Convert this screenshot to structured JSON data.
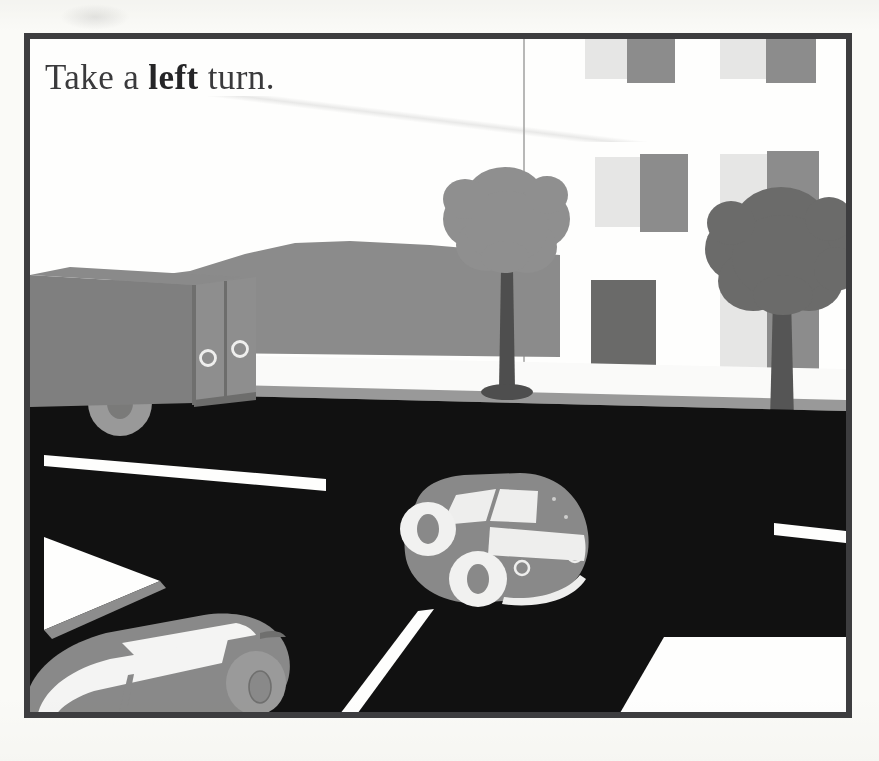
{
  "page": {
    "background_color": "#fbfbf9",
    "frame_color": "#3d3d3f",
    "frame_border_width": 6
  },
  "caption": {
    "text_before": "Take a ",
    "emphasis": "left",
    "text_after": " turn.",
    "full_text": "Take a left turn.",
    "color": "#3a3a3c"
  },
  "illustration": {
    "title": "Street scene with cars at an intersection",
    "sky_color": "#ffffff",
    "road_color": "#111111",
    "sidewalk_color": "#fbfbfb",
    "curb_color": "#9a9a9a",
    "hill_color": "#8c8c8c",
    "lane_marking_color": "#ffffff"
  },
  "building": {
    "name": "corner-building",
    "facade_color": "#ffffff",
    "edge_line_color": "#b9b9b9",
    "door": {
      "color": "#6a6a6a",
      "x": 561,
      "y": 241,
      "w": 65,
      "h": 100
    },
    "windows": [
      {
        "x": 555,
        "y": -6,
        "w": 42,
        "h": 46,
        "color": "#e7e7e7"
      },
      {
        "x": 597,
        "y": -6,
        "w": 48,
        "h": 50,
        "color": "#8d8d8d"
      },
      {
        "x": 690,
        "y": -6,
        "w": 46,
        "h": 46,
        "color": "#e7e7e7"
      },
      {
        "x": 736,
        "y": -6,
        "w": 50,
        "h": 50,
        "color": "#8d8d8d"
      },
      {
        "x": 818,
        "y": -6,
        "w": 40,
        "h": 46,
        "color": "#e7e7e7"
      },
      {
        "x": 565,
        "y": 118,
        "w": 45,
        "h": 70,
        "color": "#e7e7e7"
      },
      {
        "x": 610,
        "y": 115,
        "w": 48,
        "h": 78,
        "color": "#8d8d8d"
      },
      {
        "x": 690,
        "y": 115,
        "w": 47,
        "h": 75,
        "color": "#e7e7e7"
      },
      {
        "x": 737,
        "y": 112,
        "w": 52,
        "h": 80,
        "color": "#8d8d8d"
      },
      {
        "x": 820,
        "y": 115,
        "w": 40,
        "h": 72,
        "color": "#e7e7e7"
      },
      {
        "x": 690,
        "y": 250,
        "w": 47,
        "h": 95,
        "color": "#e7e7e7"
      },
      {
        "x": 737,
        "y": 248,
        "w": 52,
        "h": 98,
        "color": "#8d8d8d"
      },
      {
        "x": 820,
        "y": 250,
        "w": 40,
        "h": 92,
        "color": "#e7e7e7"
      }
    ]
  },
  "trees": [
    {
      "name": "tree-left",
      "canopy_color": "#909090",
      "trunk_color": "#4e4e4e",
      "base_color": "#4e4e4e",
      "center_x": 475,
      "canopy_top": 118,
      "trunk_bottom": 362
    },
    {
      "name": "tree-right",
      "canopy_color": "#6b6b6b",
      "trunk_color": "#555555",
      "base_color": "#555555",
      "center_x": 750,
      "canopy_top": 137,
      "trunk_bottom": 385
    }
  ],
  "vehicles": [
    {
      "name": "box-truck",
      "type": "truck",
      "body_color": "#808080",
      "rear_door_color": "#8f8f8f",
      "rear_door_shadow": "#6d6d6d",
      "wheel_color": "#9a9a9a",
      "hub_color": "#7a7a7a",
      "handles": 2,
      "position": "upper-left, exiting frame"
    },
    {
      "name": "car-center",
      "type": "car",
      "body_color": "#8a8a8a",
      "glass_color": "#efefef",
      "wheel_color": "#f2f2f2",
      "tire_color": "#8a8a8a",
      "taillights": 2,
      "position": "center of road, turning left"
    },
    {
      "name": "car-lower-left",
      "type": "car",
      "body_color": "#8a8a8a",
      "glass_color": "#f5f5f5",
      "wheel_color": "#9b9b9b",
      "position": "bottom-left, cropped by frame"
    }
  ],
  "road_markings": [
    {
      "name": "lane-line-upper-left",
      "color": "#ffffff"
    },
    {
      "name": "lane-line-center",
      "color": "#ffffff"
    },
    {
      "name": "lane-line-upper-right",
      "color": "#ffffff"
    },
    {
      "name": "crosswalk-block-left",
      "color": "#ffffff"
    },
    {
      "name": "crosswalk-block-right",
      "color": "#ffffff"
    }
  ]
}
